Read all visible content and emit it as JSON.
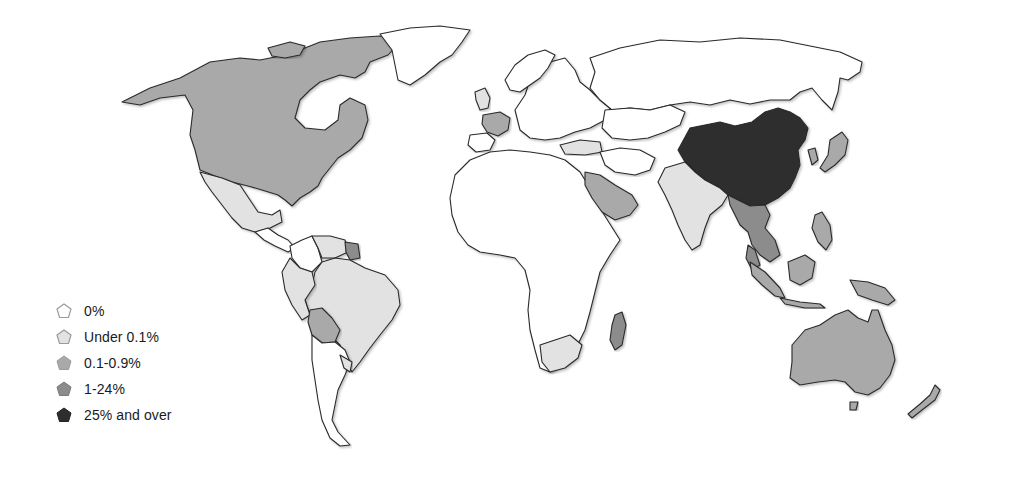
{
  "map": {
    "type": "choropleth-world",
    "colors": {
      "zero": "#ffffff",
      "under_0_1": "#e2e2e2",
      "range_0_1_0_9": "#a9a9a9",
      "range_1_24": "#8c8c8c",
      "over_25": "#2e2e2e",
      "border": "#2a2a2a"
    },
    "regions": {
      "china": "25% and over",
      "north_america_usa_canada": "0.1-0.9%",
      "mexico": "Under 0.1%",
      "brazil": "Under 0.1%",
      "bolivia": "0.1-0.9%",
      "france": "0.1-0.9%",
      "turkey": "Under 0.1%",
      "saudi_arabia": "0.1-0.9%",
      "india": "Under 0.1%",
      "southeast_asia": "1-24%",
      "japan": "0.1-0.9%",
      "australia": "0.1-0.9%",
      "new_zealand": "0.1-0.9%",
      "madagascar": "1-24%",
      "south_africa": "Under 0.1%",
      "africa_other": "0%",
      "russia": "0%",
      "europe_other": "0%"
    }
  },
  "legend": {
    "items": [
      {
        "label": "0%",
        "color": "#ffffff"
      },
      {
        "label": "Under 0.1%",
        "color": "#e2e2e2"
      },
      {
        "label": "0.1-0.9%",
        "color": "#a9a9a9"
      },
      {
        "label": "1-24%",
        "color": "#8c8c8c"
      },
      {
        "label": "25% and over",
        "color": "#2e2e2e"
      }
    ]
  }
}
